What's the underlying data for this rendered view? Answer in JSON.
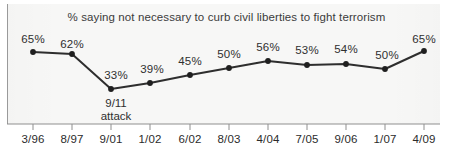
{
  "chart_data": {
    "type": "line",
    "title": "% saying not necessary to curb civil liberties to fight terrorism",
    "xlabel": "",
    "ylabel": "",
    "ylim": [
      25,
      72
    ],
    "grid": false,
    "legend": "none",
    "categories": [
      "3/96",
      "8/97",
      "9/01",
      "1/02",
      "6/02",
      "8/03",
      "4/04",
      "7/05",
      "9/06",
      "1/07",
      "4/09"
    ],
    "values": [
      65,
      62,
      33,
      39,
      45,
      50,
      56,
      53,
      54,
      50,
      65
    ],
    "point_labels": [
      "65%",
      "62%",
      "33%",
      "39%",
      "45%",
      "50%",
      "56%",
      "53%",
      "54%",
      "50%",
      "65%"
    ],
    "series": [
      {
        "name": "% saying not necessary to curb civil liberties to fight terrorism",
        "values": [
          65,
          62,
          33,
          39,
          45,
          50,
          56,
          53,
          54,
          50,
          65
        ]
      }
    ],
    "annotations": [
      {
        "text_line1": "9/11",
        "text_line2": "attack",
        "at_category": "9/01",
        "position": "below-point"
      }
    ],
    "colors": {
      "line": "#2e2e2e",
      "marker": "#1f1f1f",
      "panel_background": "#f7f7f6",
      "axis": "#8f8f8f",
      "text": "#2f2f2f"
    }
  },
  "label_offsets": {
    "comment": "rendered pixel positions read off the screenshot",
    "points": [
      {
        "x": 33,
        "y": 52,
        "label_x": 33,
        "label_y": 33
      },
      {
        "x": 72,
        "y": 54,
        "label_x": 72,
        "label_y": 38
      },
      {
        "x": 111,
        "y": 89,
        "label_x": 116,
        "label_y": 69
      },
      {
        "x": 150,
        "y": 83,
        "label_x": 152,
        "label_y": 63
      },
      {
        "x": 190,
        "y": 75,
        "label_x": 190,
        "label_y": 55
      },
      {
        "x": 229,
        "y": 68,
        "label_x": 229,
        "label_y": 48
      },
      {
        "x": 268,
        "y": 61,
        "label_x": 268,
        "label_y": 41
      },
      {
        "x": 307,
        "y": 65,
        "label_x": 307,
        "label_y": 44
      },
      {
        "x": 346,
        "y": 64,
        "label_x": 346,
        "label_y": 43
      },
      {
        "x": 385,
        "y": 69,
        "label_x": 387,
        "label_y": 49
      },
      {
        "x": 424,
        "y": 51,
        "label_x": 424,
        "label_y": 33
      }
    ],
    "x_label_y": 133,
    "annotation_x": 116,
    "annotation_y": 97,
    "axis_y": 124,
    "tick_bottom": 130
  }
}
